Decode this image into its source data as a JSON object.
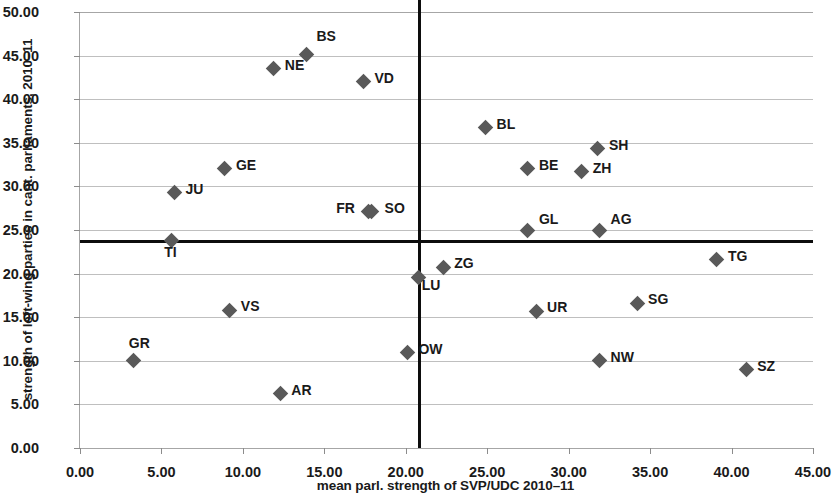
{
  "chart_data": {
    "type": "scatter",
    "title": "",
    "xlabel": "mean parl. strength of SVP/UDC 2010–11",
    "ylabel": "strength of left-wing parties in cant. parliaments, 2010–11",
    "xlim": [
      0,
      45
    ],
    "ylim": [
      0,
      50
    ],
    "xticks": [
      "0.00",
      "5.00",
      "10.00",
      "15.00",
      "20.00",
      "25.00",
      "30.00",
      "35.00",
      "40.00",
      "45.00"
    ],
    "xtick_values": [
      0,
      5,
      10,
      15,
      20,
      25,
      30,
      35,
      40,
      45
    ],
    "yticks": [
      "0.00",
      "5.00",
      "10.00",
      "15.00",
      "20.00",
      "25.00",
      "30.00",
      "35.00",
      "40.00",
      "45.00",
      "50.00"
    ],
    "ytick_values": [
      0,
      5,
      10,
      15,
      20,
      25,
      30,
      35,
      40,
      45,
      50
    ],
    "grid": "horizontal",
    "legend": "none",
    "marker": "diamond",
    "marker_color": "#595959",
    "reference_lines": [
      {
        "orientation": "vertical",
        "value": 20.75,
        "color": "#0d0d0d"
      },
      {
        "orientation": "horizontal",
        "value": 23.85,
        "color": "#0d0d0d"
      }
    ],
    "points": [
      {
        "label": "BS",
        "x": 13.9,
        "y": 45.1,
        "lx": 10,
        "ly": -19
      },
      {
        "label": "NE",
        "x": 11.9,
        "y": 43.5,
        "lx": 11,
        "ly": -4
      },
      {
        "label": "VD",
        "x": 17.4,
        "y": 42.0,
        "lx": 11,
        "ly": -4
      },
      {
        "label": "BL",
        "x": 24.9,
        "y": 36.7,
        "lx": 11,
        "ly": -4
      },
      {
        "label": "SH",
        "x": 31.8,
        "y": 34.3,
        "lx": 11,
        "ly": -4
      },
      {
        "label": "BE",
        "x": 27.5,
        "y": 32.0,
        "lx": 11,
        "ly": -4
      },
      {
        "label": "ZH",
        "x": 30.8,
        "y": 31.7,
        "lx": 11,
        "ly": -4
      },
      {
        "label": "GE",
        "x": 8.9,
        "y": 32.0,
        "lx": 11,
        "ly": -4
      },
      {
        "label": "JU",
        "x": 5.8,
        "y": 29.3,
        "lx": 11,
        "ly": -4
      },
      {
        "label": "FR",
        "x": 17.7,
        "y": 27.1,
        "lx": -32,
        "ly": -4
      },
      {
        "label": "SO",
        "x": 17.9,
        "y": 27.1,
        "lx": 13,
        "ly": -4
      },
      {
        "label": "GL",
        "x": 27.5,
        "y": 25.0,
        "lx": 11,
        "ly": -11
      },
      {
        "label": "AG",
        "x": 31.9,
        "y": 25.0,
        "lx": 11,
        "ly": -11
      },
      {
        "label": "TI",
        "x": 5.6,
        "y": 23.8,
        "lx": -7,
        "ly": 12
      },
      {
        "label": "TG",
        "x": 39.1,
        "y": 21.6,
        "lx": 11,
        "ly": -4
      },
      {
        "label": "ZG",
        "x": 22.3,
        "y": 20.7,
        "lx": 11,
        "ly": -4
      },
      {
        "label": "LU",
        "x": 20.8,
        "y": 19.6,
        "lx": 3,
        "ly": 8
      },
      {
        "label": "VS",
        "x": 9.2,
        "y": 15.8,
        "lx": 11,
        "ly": -4
      },
      {
        "label": "UR",
        "x": 28.0,
        "y": 15.7,
        "lx": 11,
        "ly": -4
      },
      {
        "label": "SG",
        "x": 34.2,
        "y": 16.6,
        "lx": 11,
        "ly": -4
      },
      {
        "label": "GR",
        "x": 3.3,
        "y": 10.0,
        "lx": -5,
        "ly": -18
      },
      {
        "label": "OW",
        "x": 20.1,
        "y": 10.9,
        "lx": 11,
        "ly": -4
      },
      {
        "label": "NW",
        "x": 31.9,
        "y": 10.0,
        "lx": 11,
        "ly": -4
      },
      {
        "label": "SZ",
        "x": 40.9,
        "y": 9.0,
        "lx": 11,
        "ly": -4
      },
      {
        "label": "AR",
        "x": 12.3,
        "y": 6.2,
        "lx": 11,
        "ly": -4
      }
    ]
  }
}
